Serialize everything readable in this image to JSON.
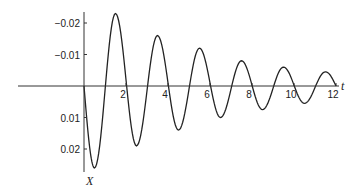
{
  "chart_data": {
    "type": "line",
    "title": "",
    "xlabel": "t",
    "ylabel": "X",
    "xlim": [
      0,
      12
    ],
    "ylim": [
      0.026,
      -0.024
    ],
    "y_axis_inverted": true,
    "grid": false,
    "legend": null,
    "x_ticks": [
      2,
      4,
      6,
      8,
      10,
      12
    ],
    "x_tick_labels": [
      "2",
      "4",
      "6",
      "8",
      "10",
      "12"
    ],
    "y_ticks": [
      -0.02,
      -0.01,
      0.01,
      0.02
    ],
    "y_tick_labels": [
      "−0.02",
      "−0.01",
      "0.01",
      "0.02"
    ],
    "series": [
      {
        "name": "X(t)",
        "extrema": [
          {
            "t": 0.0,
            "x": 0.0
          },
          {
            "t": 0.5,
            "x": 0.026
          },
          {
            "t": 1.5,
            "x": -0.023
          },
          {
            "t": 2.5,
            "x": 0.019
          },
          {
            "t": 3.5,
            "x": -0.016
          },
          {
            "t": 4.5,
            "x": 0.014
          },
          {
            "t": 5.5,
            "x": -0.012
          },
          {
            "t": 6.5,
            "x": 0.01
          },
          {
            "t": 7.5,
            "x": -0.008
          },
          {
            "t": 8.5,
            "x": 0.0075
          },
          {
            "t": 9.5,
            "x": -0.006
          },
          {
            "t": 10.5,
            "x": 0.0055
          },
          {
            "t": 11.5,
            "x": -0.0045
          },
          {
            "t": 12.0,
            "x": 0.0
          }
        ]
      }
    ]
  },
  "labels": {
    "x_axis": "t",
    "y_axis": "X"
  }
}
